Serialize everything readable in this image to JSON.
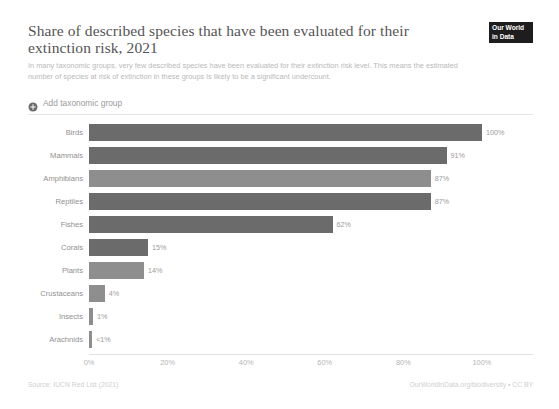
{
  "header": {
    "title": "Share of described species that have been evaluated for their extinction risk, 2021",
    "subtitle": "In many taxonomic groups, very few described species have been evaluated for their extinction risk level. This means the estimated number of species at risk of extinction in these groups is likely to be a significant undercount.",
    "logo_line1": "Our World",
    "logo_line2": "in Data"
  },
  "controls": {
    "add_group_label": "Add taxonomic group",
    "add_group_icon": "plus-circle-icon"
  },
  "footer": {
    "source": "Source: IUCN Red List (2021)",
    "attribution": "OurWorldInData.org/biodiversity • CC BY"
  },
  "chart_data": {
    "type": "bar",
    "orientation": "horizontal",
    "title": "Share of described species that have been evaluated for their extinction risk, 2021",
    "subtitle": "In many taxonomic groups, very few described species have been evaluated for their extinction risk level. This means the estimated number of species at risk of extinction in these groups is likely to be a significant undercount.",
    "xlabel": "",
    "ylabel": "",
    "xlim": [
      0,
      100
    ],
    "grid": false,
    "legend": "none",
    "tick_labels": [
      "0%",
      "20%",
      "40%",
      "60%",
      "80%",
      "100%"
    ],
    "tick_values": [
      0,
      20,
      40,
      60,
      80,
      100
    ],
    "categories": [
      "Birds",
      "Mammals",
      "Amphibians",
      "Reptiles",
      "Fishes",
      "Corals",
      "Plants",
      "Crustaceans",
      "Insects",
      "Arachnids"
    ],
    "values": [
      100,
      91,
      87,
      87,
      62,
      15,
      14,
      4,
      1,
      0.8
    ],
    "value_labels": [
      "100%",
      "91%",
      "87%",
      "87%",
      "62%",
      "15%",
      "14%",
      "4%",
      "1%",
      "<1%"
    ],
    "colors": [
      "#6b6b6b",
      "#6b6b6b",
      "#8e8e8e",
      "#6b6b6b",
      "#6b6b6b",
      "#6b6b6b",
      "#8e8e8e",
      "#8e8e8e",
      "#8e8e8e",
      "#8e8e8e"
    ],
    "bars": [
      {
        "label": "Birds",
        "value": 100,
        "value_label": "100%",
        "color": "#6b6b6b"
      },
      {
        "label": "Mammals",
        "value": 91,
        "value_label": "91%",
        "color": "#6b6b6b"
      },
      {
        "label": "Amphibians",
        "value": 87,
        "value_label": "87%",
        "color": "#8e8e8e"
      },
      {
        "label": "Reptiles",
        "value": 87,
        "value_label": "87%",
        "color": "#6b6b6b"
      },
      {
        "label": "Fishes",
        "value": 62,
        "value_label": "62%",
        "color": "#6b6b6b"
      },
      {
        "label": "Corals",
        "value": 15,
        "value_label": "15%",
        "color": "#6b6b6b"
      },
      {
        "label": "Plants",
        "value": 14,
        "value_label": "14%",
        "color": "#8e8e8e"
      },
      {
        "label": "Crustaceans",
        "value": 4,
        "value_label": "4%",
        "color": "#8e8e8e"
      },
      {
        "label": "Insects",
        "value": 1,
        "value_label": "1%",
        "color": "#8e8e8e"
      },
      {
        "label": "Arachnids",
        "value": 0.8,
        "value_label": "<1%",
        "color": "#8e8e8e"
      }
    ]
  }
}
